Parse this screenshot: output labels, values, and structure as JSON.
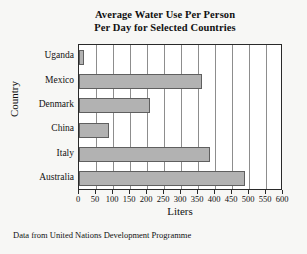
{
  "chart_data": {
    "type": "bar",
    "orientation": "horizontal",
    "title": "Average Water Use Per Person Per Day for Selected Countries",
    "title_lines": [
      "Average Water Use Per Person",
      "Per Day for Selected Countries"
    ],
    "categories": [
      "Uganda",
      "Mexico",
      "Denmark",
      "China",
      "Italy",
      "Australia"
    ],
    "values": [
      15,
      362,
      210,
      87,
      386,
      488
    ],
    "xlabel": "Liters",
    "ylabel": "Country",
    "xlim": [
      0,
      600
    ],
    "xticks": [
      0,
      50,
      100,
      150,
      200,
      250,
      300,
      350,
      400,
      450,
      500,
      550,
      600
    ],
    "xtick_labels": [
      "0",
      "50",
      "100",
      "150",
      "200",
      "250",
      "300",
      "350",
      "400",
      "450",
      "500",
      "550",
      "600"
    ],
    "grid": "vertical",
    "legend": "none",
    "bar_color": "#b2b2b2",
    "bar_border_color": "#5f5f5f",
    "plot_background": "#ffffff",
    "frame_color": "#2a2a2a",
    "gridline_color": "#8d8d8d"
  },
  "footnote": "Data from United Nations Development Programme",
  "page": {
    "background": "#f7f7f5"
  }
}
